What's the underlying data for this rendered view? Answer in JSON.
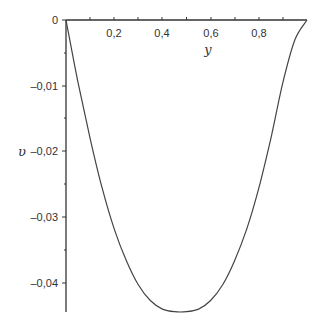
{
  "chart_data": {
    "type": "line",
    "title": "",
    "xlabel": "y",
    "ylabel": "υ",
    "xlim": [
      0,
      1
    ],
    "ylim": [
      -0.0445,
      0
    ],
    "grid": false,
    "legend": null,
    "x_ticks": [
      "0,2",
      "0,4",
      "0,6",
      "0,8"
    ],
    "y_ticks": [
      "0",
      "–0,01",
      "–0,02",
      "–0,03",
      "–0,04"
    ],
    "series": [
      {
        "name": "υ(y)",
        "x": [
          0,
          0.05,
          0.1,
          0.15,
          0.2,
          0.25,
          0.3,
          0.35,
          0.4,
          0.45,
          0.5,
          0.55,
          0.6,
          0.65,
          0.7,
          0.75,
          0.8,
          0.85,
          0.9,
          0.95,
          1.0
        ],
        "values": [
          0,
          -0.0095,
          -0.018,
          -0.0256,
          -0.0318,
          -0.0366,
          -0.0403,
          -0.0427,
          -0.044,
          -0.0444,
          -0.0444,
          -0.044,
          -0.0427,
          -0.0403,
          -0.0366,
          -0.0318,
          -0.0256,
          -0.018,
          -0.0095,
          -0.003,
          0
        ]
      }
    ],
    "colors": {
      "axis": "#333333",
      "curve": "#444444",
      "background": "#ffffff"
    }
  }
}
